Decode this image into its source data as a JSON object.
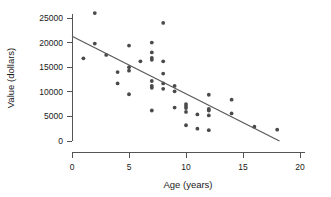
{
  "chart_data": {
    "type": "scatter",
    "title": "",
    "xlabel": "Age (years)",
    "ylabel": "Value (dollars)",
    "xlim": [
      0,
      20
    ],
    "ylim": [
      0,
      26500
    ],
    "xticks": [
      0,
      5,
      10,
      15,
      20
    ],
    "yticks": [
      0,
      5000,
      10000,
      15000,
      20000,
      25000
    ],
    "xtick_labels": [
      "0",
      "5",
      "10",
      "15",
      "20"
    ],
    "ytick_labels": [
      "0",
      "5000",
      "10000",
      "15000",
      "20000",
      "25000"
    ],
    "grid": false,
    "legend": null,
    "point_color": "#4a4a4a",
    "line_color": "#5a5a5a",
    "axis_color": "#555555",
    "background_color": "#ffffff",
    "series": [
      {
        "name": "Vehicles",
        "marker": "circle",
        "points": [
          [
            1,
            16800
          ],
          [
            2,
            26000
          ],
          [
            2,
            19800
          ],
          [
            3,
            17500
          ],
          [
            4,
            14000
          ],
          [
            4,
            11700
          ],
          [
            5,
            19400
          ],
          [
            5,
            15000
          ],
          [
            5,
            14300
          ],
          [
            5,
            9500
          ],
          [
            6,
            16200
          ],
          [
            7,
            20000
          ],
          [
            7,
            18000
          ],
          [
            7,
            16900
          ],
          [
            7,
            16500
          ],
          [
            7,
            12200
          ],
          [
            7,
            11200
          ],
          [
            7,
            10800
          ],
          [
            7,
            6200
          ],
          [
            8,
            24000
          ],
          [
            8,
            16200
          ],
          [
            8,
            13700
          ],
          [
            8,
            11700
          ],
          [
            8,
            10600
          ],
          [
            9,
            11200
          ],
          [
            9,
            10100
          ],
          [
            9,
            6800
          ],
          [
            10,
            7500
          ],
          [
            10,
            7100
          ],
          [
            10,
            6700
          ],
          [
            10,
            5900
          ],
          [
            10,
            3200
          ],
          [
            11,
            5400
          ],
          [
            11,
            2500
          ],
          [
            12,
            9400
          ],
          [
            12,
            6500
          ],
          [
            12,
            6200
          ],
          [
            12,
            5200
          ],
          [
            12,
            2200
          ],
          [
            14,
            8400
          ],
          [
            14,
            5600
          ],
          [
            16,
            2900
          ],
          [
            18,
            2300
          ]
        ]
      }
    ],
    "trend_line": {
      "name": "least-squares fit",
      "x_start": 0,
      "y_start": 21300,
      "x_end": 18.2,
      "y_end": 0
    }
  }
}
